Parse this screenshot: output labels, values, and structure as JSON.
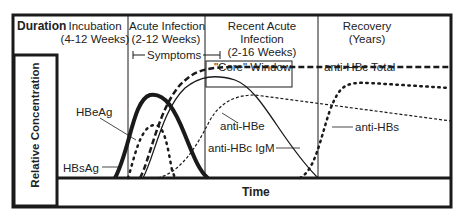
{
  "header": {
    "duration_label": "Duration",
    "phases": [
      {
        "line1": "Incubation",
        "line2": "(4-12 Weeks)"
      },
      {
        "line1": "Acute Infection",
        "line2": "(2-12 Weeks)"
      },
      {
        "line1": "Recent Acute",
        "line2": "Infection",
        "line3": "(2-16 Weeks)"
      },
      {
        "line1": "Recovery",
        "line2": "(Years)"
      }
    ]
  },
  "annotations": {
    "symptoms": "Symptoms",
    "core_window": "\"Core\" Window"
  },
  "axes": {
    "y_label": "Relative Concentration",
    "x_label": "Time"
  },
  "series_labels": {
    "hbeag": "HBeAg",
    "hbsag": "HBsAg",
    "anti_hbc_total": "anti-HBc Total",
    "anti_hbe": "anti-HBe",
    "anti_hbc_igm": "anti-HBc IgM",
    "anti_hbs": "anti-HBs"
  },
  "colors": {
    "ink": "#1a1a1a",
    "background": "#ffffff"
  }
}
